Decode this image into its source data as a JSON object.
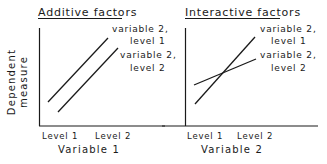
{
  "panels": [
    {
      "title": "Additive factors",
      "x_label": "Variable 1",
      "x_ticks": [
        "Level 1",
        "Level 2"
      ],
      "legend": [
        {
          "line1": "variable 2,",
          "line2": "level 1"
        },
        {
          "line1": "variable 2,",
          "line2": "level 2"
        }
      ]
    },
    {
      "title": "Interactive factors",
      "x_label": "Variable 2",
      "x_ticks": [
        "Level 1",
        "Level 2"
      ],
      "legend": [
        {
          "line1": "variable 2,",
          "line2": "level 1"
        },
        {
          "line1": "variable 2,",
          "line2": "level 2"
        }
      ]
    }
  ],
  "y_label_line1": "Dependent",
  "y_label_line2": "measure",
  "colors": {
    "ink": "#1a1a1a",
    "background": "#ffffff"
  }
}
